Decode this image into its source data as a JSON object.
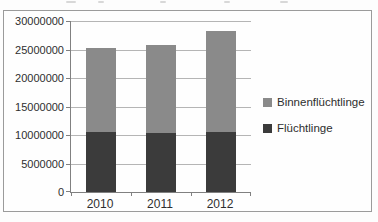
{
  "chart_data": {
    "type": "bar",
    "stacked": true,
    "title": "",
    "categories": [
      "2010",
      "2011",
      "2012"
    ],
    "series": [
      {
        "name": "Flüchtlinge",
        "color": "#3b3b3b",
        "values": [
          10500000,
          10400000,
          10500000
        ]
      },
      {
        "name": "Binnenflüchtlinge",
        "color": "#8a8a8a",
        "values": [
          14700000,
          15500000,
          17700000
        ]
      }
    ],
    "totals": [
      25200000,
      25900000,
      28200000
    ],
    "ylim": [
      0,
      30000000
    ],
    "ytick_interval": 5000000,
    "yticks": [
      "30000000",
      "25000000",
      "20000000",
      "15000000",
      "10000000",
      "5000000",
      "0"
    ],
    "xlabel": "",
    "ylabel": "",
    "grid": true,
    "legend_position": "right",
    "legend_order": [
      "Binnenflüchtlinge",
      "Flüchtlinge"
    ]
  },
  "colors": {
    "grid": "#b5b5b5",
    "axis": "#808080",
    "text": "#2e2e2e",
    "frame_border": "#9b9b9b",
    "background": "#fdfdfd"
  }
}
